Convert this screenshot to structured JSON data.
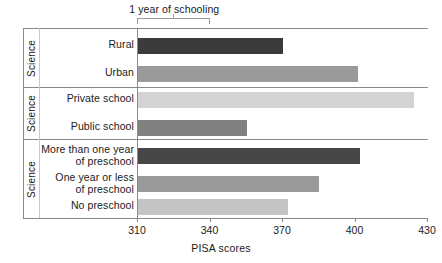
{
  "annotation": {
    "label": "1 year of schooling",
    "span_start": 310,
    "span_end": 340
  },
  "axis": {
    "title": "PISA scores",
    "ticks": [
      "310",
      "340",
      "370",
      "400",
      "430"
    ],
    "min": 310,
    "max": 430
  },
  "panels": [
    {
      "strip_label": "Science"
    },
    {
      "strip_label": "Science"
    },
    {
      "strip_label": "Science"
    }
  ],
  "bars": [
    {
      "label": "Rural",
      "value": 370,
      "color": "#3b3b3b"
    },
    {
      "label": "Urban",
      "value": 401,
      "color": "#9a9a9a"
    },
    {
      "label": "Private school",
      "value": 424,
      "color": "#d4d4d4"
    },
    {
      "label": "Public school",
      "value": 355,
      "color": "#808080"
    },
    {
      "label": "More than one year\nof preschool",
      "value": 402,
      "color": "#474747"
    },
    {
      "label": "One year or less\nof preschool",
      "value": 385,
      "color": "#9a9a9a"
    },
    {
      "label": "No preschool",
      "value": 372,
      "color": "#c4c4c4"
    }
  ],
  "chart_data": {
    "type": "bar",
    "orientation": "horizontal",
    "title": "",
    "xlabel": "PISA scores",
    "ylabel": "",
    "xlim": [
      310,
      430
    ],
    "xticks": [
      310,
      340,
      370,
      400,
      430
    ],
    "grid": false,
    "legend": null,
    "annotations": [
      {
        "text": "1 year of schooling",
        "from": 310,
        "to": 340
      }
    ],
    "panels": [
      {
        "strip_label": "Science",
        "categories": [
          "Rural",
          "Urban"
        ],
        "values": [
          370,
          401
        ]
      },
      {
        "strip_label": "Science",
        "categories": [
          "Private school",
          "Public school"
        ],
        "values": [
          424,
          355
        ]
      },
      {
        "strip_label": "Science",
        "categories": [
          "More than one year of preschool",
          "One year or less of preschool",
          "No preschool"
        ],
        "values": [
          402,
          385,
          372
        ]
      }
    ],
    "categories": [
      "Rural",
      "Urban",
      "Private school",
      "Public school",
      "More than one year of preschool",
      "One year or less of preschool",
      "No preschool"
    ],
    "values": [
      370,
      401,
      424,
      355,
      402,
      385,
      372
    ]
  }
}
